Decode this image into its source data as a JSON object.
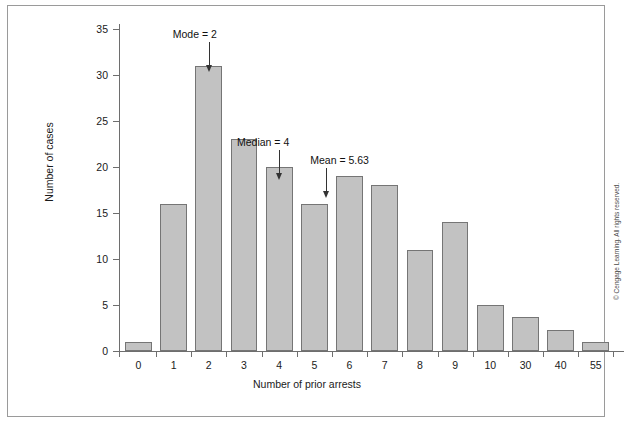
{
  "chart_data": {
    "type": "bar",
    "title": "",
    "xlabel": "Number of prior arrests",
    "ylabel": "Number of cases",
    "categories": [
      "0",
      "1",
      "2",
      "3",
      "4",
      "5",
      "6",
      "7",
      "8",
      "9",
      "10",
      "30",
      "40",
      "55"
    ],
    "values": [
      1,
      16,
      31,
      23,
      20,
      16,
      19,
      18,
      11,
      14,
      5,
      3.7,
      2.3,
      1
    ],
    "ylim": [
      0,
      35
    ],
    "yticks": [
      0,
      5,
      10,
      15,
      20,
      25,
      30,
      35
    ],
    "grid": false,
    "legend": "none",
    "bar_fill": "#c2c2c2",
    "bar_border": "#757575",
    "annotations": [
      {
        "label": "Mode = 2",
        "category": "2",
        "value": 2
      },
      {
        "label": "Median = 4",
        "category": "4",
        "value": 4
      },
      {
        "label": "Mean = 5.63",
        "category": "5.63",
        "value": 5.63
      }
    ]
  },
  "figure": {
    "copyright": "© Cengage Learning. All rights reserved.",
    "caption": ""
  }
}
